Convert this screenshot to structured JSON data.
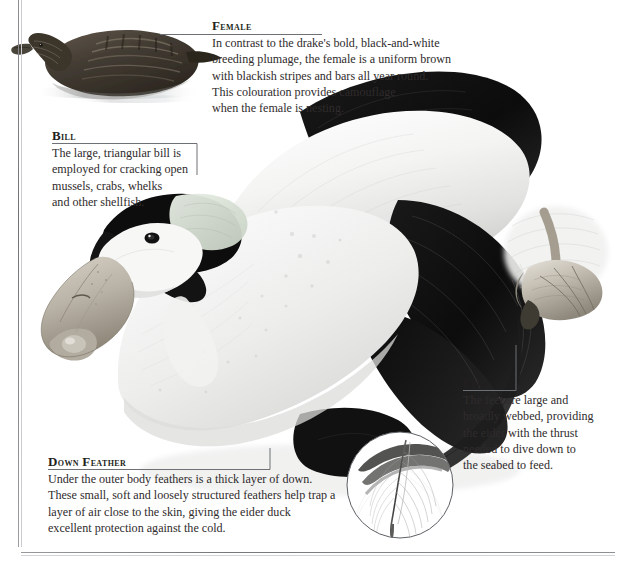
{
  "page": {
    "background_color": "#ffffff",
    "rule_color": "#6f7276",
    "text_color": "#2f2b2c"
  },
  "annotations": [
    {
      "id": "female",
      "title": "Female",
      "body": "In contrast to the drake's bold, black-and-white\nbreeding plumage, the female is a uniform brown\nwith blackish stripes and bars all year round.\nThis colouration provides camouflage\nwhen the female is nesting."
    },
    {
      "id": "bill",
      "title": "Bill",
      "body": "The large, triangular bill is\nemployed for cracking open\nmussels, crabs, whelks\nand other shellfish."
    },
    {
      "id": "feet",
      "title": "Feet",
      "body": "The feet are large and\nbroadly webbed, providing\nthe eider with the thrust\nneeded to dive down to\nthe seabed to feed."
    },
    {
      "id": "down-feather",
      "title": "Down feather",
      "body": "Under the outer body feathers is a thick layer of down.\nThese small, soft and loosely structured feathers help trap a\nlayer of air close to the skin, giving the eider duck\nexcellent protection against the cold."
    }
  ],
  "illustrations": {
    "female_duck": "female-eider-swimming",
    "drake_main": "male-eider-drake-preening",
    "feather_detail": "down-feather-closeup",
    "foot_detail": "webbed-foot-closeup"
  }
}
